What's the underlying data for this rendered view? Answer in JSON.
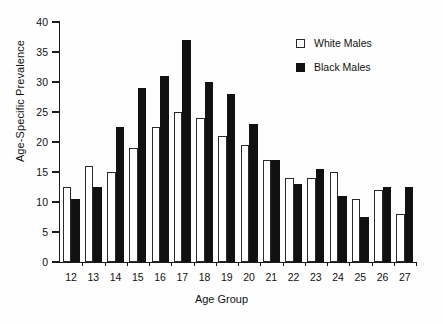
{
  "chart_data": {
    "type": "bar",
    "title": "",
    "xlabel": "Age Group",
    "ylabel": "Age-Specific Prevalence",
    "categories": [
      "12",
      "13",
      "14",
      "15",
      "16",
      "17",
      "18",
      "19",
      "20",
      "21",
      "22",
      "23",
      "24",
      "25",
      "26",
      "27"
    ],
    "series": [
      {
        "name": "White Males",
        "color": "#ffffff",
        "values": [
          12.5,
          16,
          15,
          19,
          22.5,
          25,
          24,
          21,
          19.5,
          17,
          14,
          14,
          15,
          10.5,
          12,
          8
        ]
      },
      {
        "name": "Black Males",
        "color": "#111111",
        "values": [
          10.5,
          12.5,
          22.5,
          29,
          31,
          37,
          30,
          28,
          23,
          17,
          13,
          15.5,
          11,
          7.5,
          12.5,
          12.5
        ]
      }
    ],
    "ylim": [
      0,
      40
    ],
    "yticks": [
      0,
      5,
      10,
      15,
      20,
      25,
      30,
      35,
      40
    ],
    "ytick_labels": [
      "0",
      "5",
      "10",
      "15",
      "20",
      "25",
      "30",
      "35",
      "40"
    ],
    "grid": false,
    "legend_position": "top-right"
  },
  "legend": {
    "items": [
      {
        "label": "White Males",
        "swatch": "open-square"
      },
      {
        "label": "Black Males",
        "swatch": "filled-square"
      }
    ]
  }
}
